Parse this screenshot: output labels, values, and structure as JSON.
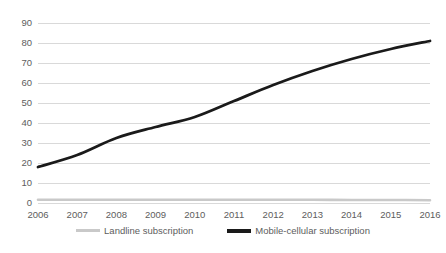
{
  "chart_data": {
    "type": "line",
    "title": "",
    "subtitle": "",
    "xlabel": "",
    "ylabel": "",
    "categories": [
      "2006",
      "2007",
      "2008",
      "2009",
      "2010",
      "2011",
      "2012",
      "2013",
      "2014",
      "2015",
      "2016"
    ],
    "x": [
      2006,
      2007,
      2008,
      2009,
      2010,
      2011,
      2012,
      2013,
      2014,
      2015,
      2016
    ],
    "series": [
      {
        "name": "Landline subscription",
        "color": "#c9c9c9",
        "values": [
          1.6,
          1.6,
          1.6,
          1.6,
          1.6,
          1.6,
          1.6,
          1.6,
          1.5,
          1.5,
          1.4
        ]
      },
      {
        "name": "Mobile-cellular subscription",
        "color": "#1a1a1a",
        "values": [
          18,
          24,
          32.5,
          38,
          43,
          51,
          59,
          66,
          72,
          77,
          81
        ]
      }
    ],
    "ylim": [
      0,
      90
    ],
    "ytick_labels": [
      "0",
      "10",
      "20",
      "30",
      "40",
      "50",
      "60",
      "70",
      "80",
      "90"
    ],
    "yticks": [
      0,
      10,
      20,
      30,
      40,
      50,
      60,
      70,
      80,
      90
    ],
    "grid": true,
    "grid_color": "#d9d9d9",
    "legend_position": "bottom",
    "background": "#ffffff"
  },
  "legend": {
    "items": [
      {
        "label": "Landline subscription"
      },
      {
        "label": "Mobile-cellular subscription"
      }
    ]
  }
}
